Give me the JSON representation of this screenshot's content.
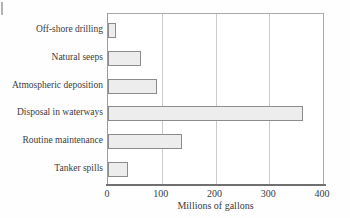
{
  "chart_data": {
    "type": "bar",
    "orientation": "horizontal",
    "xlabel": "Millions of gallons",
    "categories": [
      "Off-shore drilling",
      "Natural seeps",
      "Atmospheric deposition",
      "Disposal in waterways",
      "Routine maintenance",
      "Tanker spills"
    ],
    "values": [
      15,
      62,
      92,
      363,
      137,
      37
    ],
    "xlim": [
      0,
      400
    ],
    "xticks": [
      0,
      100,
      200,
      300,
      400
    ],
    "grid": true,
    "legend": false,
    "colors": {
      "bar_fill": "#ededed",
      "bar_border": "#8c8c8c",
      "gridline": "#cbcbcb",
      "frame": "#a9a9a9",
      "axis": "#707070",
      "text": "#3b3b3b",
      "background": "#ffffff"
    }
  }
}
